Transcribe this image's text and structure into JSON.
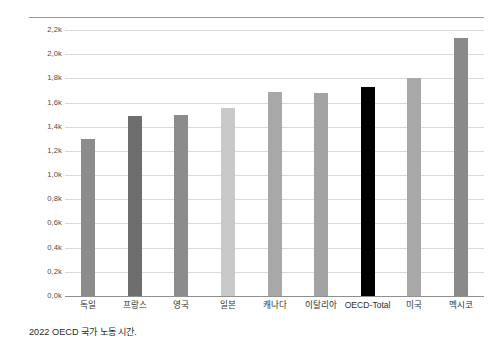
{
  "caption": "2022 OECD 국가 노동 시간.",
  "axis": {
    "y_ticks": [
      "2,2k",
      "2,0k",
      "1,8k",
      "1,6k",
      "1,4k",
      "1,2k",
      "1,0k",
      "0,8k",
      "0,6k",
      "0,4k",
      "0,2k",
      "0,0k"
    ],
    "y_tick_values": [
      2200,
      2000,
      1800,
      1600,
      1400,
      1200,
      1000,
      800,
      600,
      400,
      200,
      0
    ]
  },
  "colors": {
    "gridline": "#d8d8d8",
    "baseline": "#8f8f8f",
    "top_rule": "#9a9a9a",
    "highlight_bar": "#000000",
    "text": "#303030"
  },
  "chart_data": {
    "type": "bar",
    "title": "",
    "subtitle": "",
    "xlabel": "",
    "ylabel": "",
    "ylim": [
      0,
      2200
    ],
    "ytick_step": 200,
    "grid": true,
    "legend": "none",
    "categories": [
      "독일",
      "프랑스",
      "영국",
      "일본",
      "캐나다",
      "이탈리아",
      "OECD-Total",
      "미국",
      "멕시코"
    ],
    "values": [
      1295,
      1490,
      1495,
      1555,
      1685,
      1680,
      1730,
      1805,
      2135
    ],
    "bar_colors": [
      "#8c8c8c",
      "#6e6e6e",
      "#8c8c8c",
      "#c9c9c9",
      "#a8a8a8",
      "#a3a3a3",
      "#000000",
      "#a8a8a8",
      "#8a8a8a"
    ],
    "annotations": [
      "2022 OECD 국가 노동 시간."
    ]
  }
}
